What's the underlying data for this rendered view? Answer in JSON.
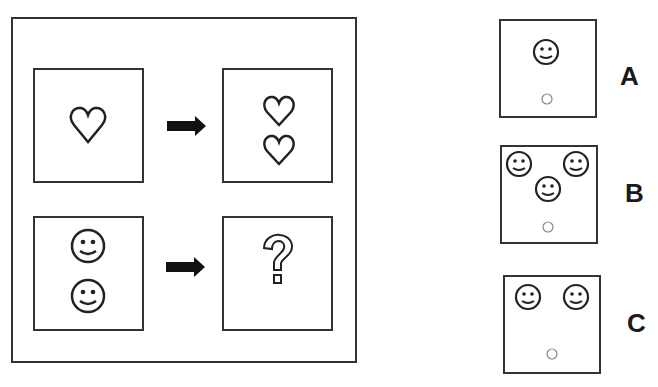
{
  "puzzle": {
    "example": {
      "input_symbol": "heart-icon",
      "input_count": 1,
      "output_symbol": "heart-icon",
      "output_count": 2
    },
    "question": {
      "input_symbol": "smiley-icon",
      "input_count": 2,
      "output": "?"
    },
    "colors": {
      "stroke": "#333333",
      "background": "#ffffff"
    }
  },
  "options": [
    {
      "label": "A",
      "smileys": 1
    },
    {
      "label": "B",
      "smileys": 3
    },
    {
      "label": "C",
      "smileys": 2
    }
  ]
}
